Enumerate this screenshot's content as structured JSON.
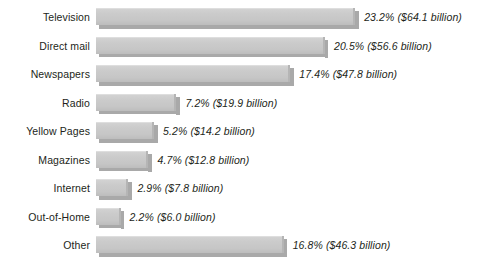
{
  "chart_data": {
    "type": "bar",
    "orientation": "horizontal",
    "title": "",
    "subtitle": "",
    "xlabel": "",
    "ylabel": "",
    "grid": false,
    "legend": null,
    "axis_visible": false,
    "xlim": [
      0,
      23.2
    ],
    "categories": [
      "Television",
      "Direct mail",
      "Newspapers",
      "Radio",
      "Yellow Pages",
      "Magazines",
      "Internet",
      "Out-of-Home",
      "Other"
    ],
    "values": [
      23.2,
      20.5,
      17.4,
      7.2,
      5.2,
      4.7,
      2.9,
      2.2,
      16.8
    ],
    "value_unit": "percent",
    "dollars_billion": [
      64.1,
      56.6,
      47.8,
      19.9,
      14.2,
      12.8,
      7.8,
      6.0,
      46.3
    ],
    "data_labels": [
      "23.2% ($64.1 billion)",
      "20.5% ($56.6 billion)",
      "17.4% ($47.8 billion)",
      "7.2% ($19.9 billion)",
      "5.2% ($14.2 billion)",
      "4.7% ($12.8 billion)",
      "2.9% ($7.8 billion)",
      "2.2% ($6.0 billion)",
      "16.8% ($46.3 billion)"
    ],
    "bar_color": "#c9c9c9",
    "bar_shadow_color": "#a9a9a9",
    "text_color": "#231f20",
    "background_color": "#ffffff"
  },
  "rows": [
    {
      "label": "Television",
      "data_label": "23.2% ($64.1 billion)",
      "value": 23.2
    },
    {
      "label": "Direct mail",
      "data_label": "20.5% ($56.6 billion)",
      "value": 20.5
    },
    {
      "label": "Newspapers",
      "data_label": "17.4% ($47.8 billion)",
      "value": 17.4
    },
    {
      "label": "Radio",
      "data_label": "7.2% ($19.9 billion)",
      "value": 7.2
    },
    {
      "label": "Yellow Pages",
      "data_label": "5.2% ($14.2 billion)",
      "value": 5.2
    },
    {
      "label": "Magazines",
      "data_label": "4.7% ($12.8 billion)",
      "value": 4.7
    },
    {
      "label": "Internet",
      "data_label": "2.9% ($7.8 billion)",
      "value": 2.9
    },
    {
      "label": "Out-of-Home",
      "data_label": "2.2% ($6.0 billion)",
      "value": 2.2
    },
    {
      "label": "Other",
      "data_label": "16.8% ($46.3 billion)",
      "value": 16.8
    }
  ],
  "scale": {
    "px_per_percent": 11.17,
    "bar_origin_x": 96,
    "label_gap_px": 9
  }
}
